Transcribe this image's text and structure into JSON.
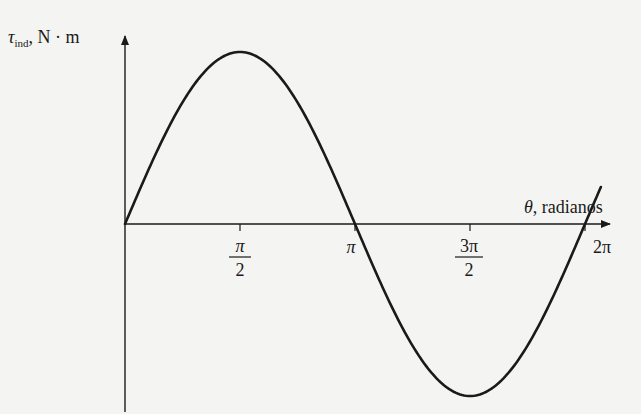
{
  "chart_data": {
    "type": "line",
    "title": "",
    "xlabel": "θ, radianos",
    "ylabel": "τind, N · m",
    "ylabel_parts": {
      "symbol": "τ",
      "subscript": "ind",
      "units": ", N · m"
    },
    "xlabel_parts": {
      "symbol": "θ",
      "text": ", radianos"
    },
    "x_ticks": [
      {
        "value": 1.5708,
        "label_num": "π",
        "label_den": "2"
      },
      {
        "value": 3.1416,
        "label": "π"
      },
      {
        "value": 4.7124,
        "label_num": "3π",
        "label_den": "2"
      },
      {
        "value": 6.2832,
        "label": "2π"
      }
    ],
    "xlim": [
      0,
      6.6
    ],
    "ylim": [
      -1.1,
      1.0
    ],
    "grid": false,
    "legend": null,
    "series": [
      {
        "name": "τind = sin(θ)",
        "function": "sin",
        "x": [
          0,
          0.3927,
          0.7854,
          1.1781,
          1.5708,
          1.9635,
          2.3562,
          2.7489,
          3.1416,
          3.5343,
          3.927,
          4.3197,
          4.7124,
          5.1051,
          5.4978,
          5.8905,
          6.2832,
          6.5
        ],
        "values": [
          0,
          0.383,
          0.707,
          0.924,
          1.0,
          0.924,
          0.707,
          0.383,
          0,
          -0.383,
          -0.707,
          -0.924,
          -1.0,
          -0.924,
          -0.707,
          -0.383,
          0,
          0.213
        ]
      }
    ]
  }
}
